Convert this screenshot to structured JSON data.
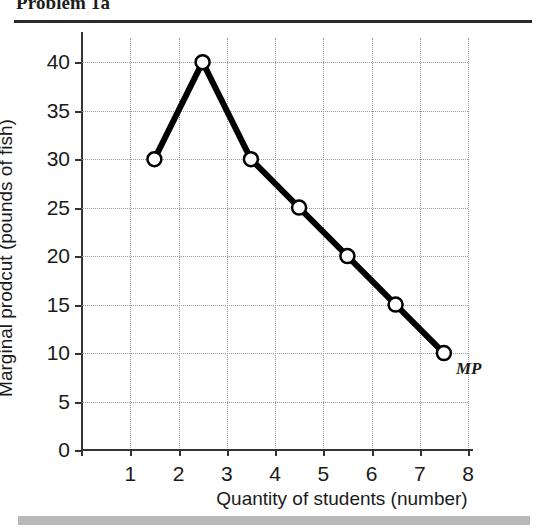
{
  "header": {
    "title": "Problem 1a"
  },
  "footer": {
    "bar_color": "#b9b9b9"
  },
  "chart_data": {
    "type": "line",
    "title": "Problem 1a",
    "xlabel": "Quantity of students (number)",
    "ylabel": "Marginal prodcut (pounds of fish)",
    "xlim": [
      0,
      8
    ],
    "ylim": [
      0,
      42.5
    ],
    "grid": true,
    "legend_position": "inline-end",
    "marker": "open-circle",
    "line_color": "#000000",
    "grid_color": "#9a9a9a",
    "xticks": [
      1,
      2,
      3,
      4,
      5,
      6,
      7,
      8
    ],
    "xtick_labels": [
      "1",
      "2",
      "3",
      "4",
      "5",
      "6",
      "7",
      "8"
    ],
    "yticks": [
      0,
      5,
      10,
      15,
      20,
      25,
      30,
      35,
      40
    ],
    "ytick_labels": [
      "0",
      "5",
      "10",
      "15",
      "20",
      "25",
      "30",
      "35",
      "40"
    ],
    "series": [
      {
        "name": "MP",
        "annotation": "MP",
        "x": [
          1.5,
          2.5,
          3.5,
          4.5,
          5.5,
          6.5,
          7.5
        ],
        "values": [
          30,
          40,
          30,
          25,
          20,
          15,
          10
        ]
      }
    ]
  }
}
